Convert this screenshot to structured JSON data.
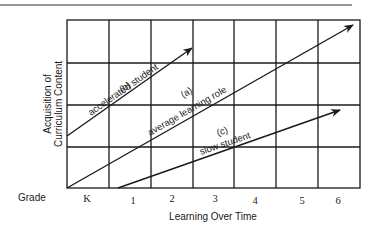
{
  "diagram": {
    "y_axis_label_line1": "Acquisition of",
    "y_axis_label_line2": "Curriculum Content",
    "x_axis_label": "Learning Over Time",
    "grade_label": "Grade",
    "grades": [
      "K",
      "1",
      "2",
      "3",
      "4",
      "5",
      "6"
    ],
    "lines": [
      {
        "id": "b",
        "tag": "(b)",
        "label": "accelerated student"
      },
      {
        "id": "a",
        "tag": "(a)",
        "label": "average learning role"
      },
      {
        "id": "c",
        "tag": "(c)",
        "label": "slow student"
      }
    ],
    "colors": {
      "ink": "#1a1a1a",
      "background": "#ffffff"
    }
  }
}
